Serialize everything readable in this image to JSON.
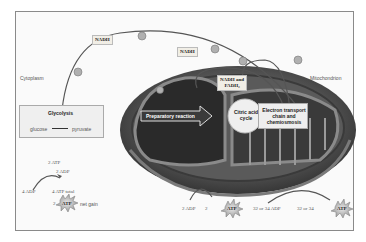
{
  "diagram": {
    "regions": {
      "cytoplasm": "Cytoplasm",
      "mitochondrion": "Mitochondrion"
    },
    "carriers": {
      "nadh_top": "NADH",
      "nadh_mid": "NADH",
      "nadh_fadh2_line1": "NADH and",
      "nadh_fadh2_line2": "FADH₂"
    },
    "glycolysis": {
      "title": "Glycolysis",
      "from": "glucose",
      "to": "pyruvate"
    },
    "stages": {
      "preparatory": "Preparatory reaction",
      "citric_line1": "Citric acid",
      "citric_line2": "cycle",
      "etc_line1": "Electron transport",
      "etc_line2": "chain and",
      "etc_line3": "chemiosmosis"
    },
    "glycolysis_atp": {
      "used_atp": "2 ATP",
      "used_adp": "2 ADP",
      "input_adp": "4 ADP",
      "total": "4 ATP total",
      "net_count": "2",
      "net_atp": "ATP",
      "net_label": "net gain"
    },
    "citric_atp": {
      "input_adp": "2 ADP",
      "count": "2",
      "atp": "ATP"
    },
    "etc_atp": {
      "input_adp": "32 or 34 ADP",
      "count": "32 or 34",
      "atp": "ATP"
    },
    "colors": {
      "frame": "#8a8a8a",
      "mito_outer": "#4a4a4a",
      "mito_inner": "#6e6e6e",
      "label_bg": "#f1eee6",
      "arrow": "#555555"
    }
  }
}
